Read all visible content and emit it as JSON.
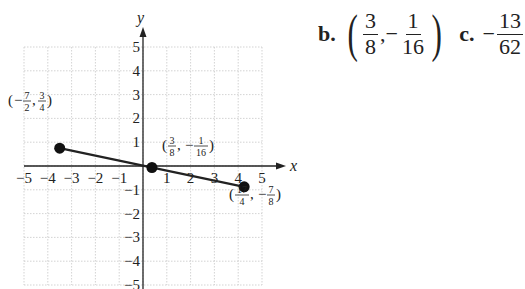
{
  "answers": {
    "b": {
      "label": "b.",
      "x_num": "3",
      "x_den": "8",
      "comma": ",",
      "y_sign": "−",
      "y_num": "1",
      "y_den": "16",
      "open": "(",
      "close": ")"
    },
    "c": {
      "label": "c.",
      "sign": "−",
      "num": "13",
      "den": "62"
    }
  },
  "chart_data": {
    "type": "line",
    "title": "",
    "xlabel": "x",
    "ylabel": "y",
    "xlim": [
      -5,
      5
    ],
    "ylim": [
      -5,
      5
    ],
    "grid": true,
    "x_ticks": [
      "−5",
      "−4",
      "−3",
      "−2",
      "−1",
      "1",
      "2",
      "3",
      "4",
      "5"
    ],
    "y_ticks": [
      "5",
      "4",
      "3",
      "2",
      "1",
      "−1",
      "−2",
      "−3",
      "−4",
      "−5"
    ],
    "points": [
      {
        "x": -3.5,
        "y": 0.75,
        "label": "(−7/2, 3/4)"
      },
      {
        "x": 0.375,
        "y": -0.0625,
        "label": "(3/8, −1/16)"
      },
      {
        "x": 4.25,
        "y": -0.875,
        "label": "(17/4, −7/8)"
      }
    ],
    "segment": {
      "from": [
        -3.5,
        0.75
      ],
      "to": [
        4.25,
        -0.875
      ]
    }
  }
}
